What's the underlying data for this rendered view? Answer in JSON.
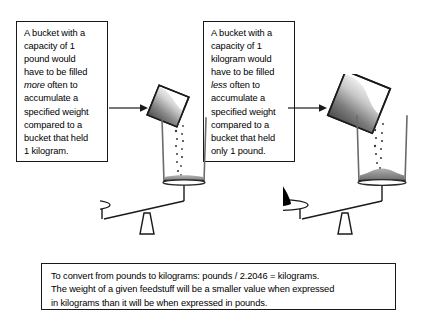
{
  "figure": {
    "background_color": "#ffffff",
    "line_color": "#1a1a1a"
  },
  "callout_left": {
    "text": "A bucket with a\ncapacity of 1\npound would\nhave to be filled\n",
    "emphasis": "more",
    "text_after": " often to\naccumulate a\nspecified weight\ncompared to a\nbucket that held\n1 kilogram."
  },
  "callout_right": {
    "text": "A bucket with a\ncapacity of 1\nkilogram would\nhave to be filled\n",
    "emphasis": "less",
    "text_after": " often to\naccumulate a\nspecified weight\ncompared to a\nbucket that held\nonly 1 pound."
  },
  "footnote": {
    "line1": "To convert from pounds to kilograms:  pounds / 2.2046 = kilograms.",
    "line2": "The weight of a given feedstuff will be a smaller value when expressed",
    "line3": "in kilograms than it will be when expressed in pounds."
  },
  "scene_left": {
    "label": "one-pound-scoop-filling-bucket-on-balance",
    "scoop_size": "small",
    "bucket_fill": "thin-layer",
    "balance_state": "weight-side-down"
  },
  "scene_right": {
    "label": "one-kilogram-scoop-filling-bucket-on-balance",
    "scoop_size": "large",
    "bucket_fill": "mound",
    "balance_state": "weight-side-down"
  }
}
